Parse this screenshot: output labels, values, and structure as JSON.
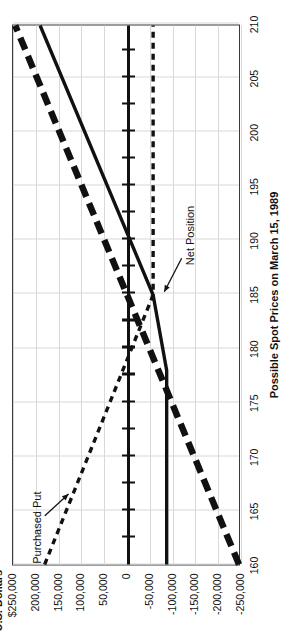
{
  "chart_data": {
    "type": "line",
    "title": "",
    "xlabel": "Possible Spot Prices on March 15, 1989",
    "ylabel": "U.S. Dollars",
    "orientation": "rotated-90-ccw",
    "grid": true,
    "legend_position": "inline-annotations",
    "xlim": [
      160,
      210
    ],
    "ylim": [
      -250000,
      250000
    ],
    "x_ticks": [
      160,
      165,
      170,
      175,
      180,
      185,
      190,
      195,
      200,
      205,
      210
    ],
    "x_tick_labels": [
      "160",
      "165",
      "170",
      "175",
      "180",
      "185",
      "190",
      "195",
      "200",
      "205",
      "210"
    ],
    "y_ticks": [
      250000,
      200000,
      150000,
      100000,
      50000,
      0,
      -50000,
      -100000,
      -150000,
      -200000,
      -250000
    ],
    "y_tick_labels": [
      "$250,000",
      "200,000",
      "150,000",
      "100,000",
      "50,000",
      "0",
      "-50,000",
      "-100,000",
      "-150,000",
      "-200,000",
      "-250,000"
    ],
    "series": [
      {
        "name": "Underlying Position",
        "style": "heavy-dashed",
        "color": "#111111",
        "x": [
          160,
          210
        ],
        "values": [
          -250000,
          245000
        ]
      },
      {
        "name": "Purchased Put",
        "style": "fine-dashed",
        "color": "#111111",
        "x": [
          160,
          185,
          210
        ],
        "values": [
          180000,
          -60000,
          -60000
        ]
      },
      {
        "name": "Net Position",
        "style": "solid",
        "color": "#111111",
        "x": [
          160,
          178,
          185,
          210
        ],
        "values": [
          -90000,
          -90000,
          -60000,
          190000
        ]
      }
    ],
    "annotations": [
      {
        "label": "Purchased Put",
        "points_to_x": 166,
        "points_to_y": 120000
      },
      {
        "label": "Net Position",
        "points_to_x": 182,
        "points_to_y": -88000
      }
    ]
  },
  "axes": {
    "y_title": "U.S. Dollars",
    "x_title": "Possible Spot Prices on March 15, 1989"
  },
  "annotations": {
    "purchased_put": "Purchased Put",
    "net_position": "Net Position"
  },
  "colors": {
    "ink": "#111111",
    "frame": "#3a3a3a",
    "grid": "#d8d8d8",
    "background": "#ffffff"
  }
}
